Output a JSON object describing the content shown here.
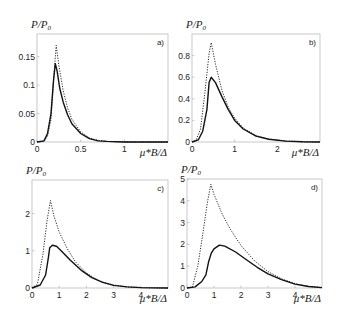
{
  "chart_data": [
    {
      "type": "line",
      "panel": "a)",
      "ylabel": "P/P0",
      "xlabel": "μ*B/Δ",
      "xlim": [
        0,
        1.5
      ],
      "ylim": [
        0,
        0.19
      ],
      "xticks": [
        "0",
        "0.5",
        "1"
      ],
      "yticks": [
        "0",
        "0.05",
        "0.1",
        "0.15"
      ],
      "grid": false,
      "series": [
        {
          "name": "solid",
          "style": "solid",
          "x": [
            0,
            0.08,
            0.12,
            0.16,
            0.19,
            0.21,
            0.23,
            0.26,
            0.3,
            0.35,
            0.4,
            0.5,
            0.6,
            0.7,
            0.8,
            1.0,
            1.2,
            1.5
          ],
          "y": [
            0,
            0.002,
            0.015,
            0.05,
            0.11,
            0.138,
            0.125,
            0.095,
            0.07,
            0.048,
            0.032,
            0.015,
            0.006,
            0.002,
            0.001,
            0,
            0,
            0
          ]
        },
        {
          "name": "dashed",
          "style": "dotted",
          "x": [
            0,
            0.08,
            0.12,
            0.16,
            0.19,
            0.22,
            0.25,
            0.3,
            0.35,
            0.4,
            0.5,
            0.6,
            0.7,
            0.8,
            1.0,
            1.2,
            1.5
          ],
          "y": [
            0,
            0.001,
            0.01,
            0.04,
            0.11,
            0.17,
            0.135,
            0.09,
            0.06,
            0.04,
            0.018,
            0.007,
            0.003,
            0.001,
            0,
            0,
            0
          ]
        }
      ]
    },
    {
      "type": "line",
      "panel": "b)",
      "ylabel": "P/P0",
      "xlabel": "μ*B/Δ",
      "xlim": [
        0,
        3
      ],
      "ylim": [
        0,
        1.0
      ],
      "xticks": [
        "0",
        "1",
        "2"
      ],
      "yticks": [
        "0",
        "0.2",
        "0.4",
        "0.6",
        "0.8"
      ],
      "grid": false,
      "series": [
        {
          "name": "solid",
          "style": "solid",
          "x": [
            0,
            0.15,
            0.25,
            0.35,
            0.4,
            0.45,
            0.55,
            0.7,
            0.85,
            1.0,
            1.2,
            1.5,
            1.8,
            2.2,
            2.6,
            3.0
          ],
          "y": [
            0,
            0.02,
            0.1,
            0.3,
            0.55,
            0.6,
            0.55,
            0.42,
            0.3,
            0.2,
            0.12,
            0.055,
            0.025,
            0.008,
            0.002,
            0
          ]
        },
        {
          "name": "dashed",
          "style": "dotted",
          "x": [
            0,
            0.1,
            0.2,
            0.3,
            0.4,
            0.45,
            0.55,
            0.7,
            0.85,
            1.0,
            1.2,
            1.5,
            1.8,
            2.2,
            2.6,
            3.0
          ],
          "y": [
            0,
            0.02,
            0.12,
            0.45,
            0.82,
            0.92,
            0.72,
            0.48,
            0.32,
            0.22,
            0.13,
            0.06,
            0.027,
            0.009,
            0.002,
            0
          ]
        }
      ]
    },
    {
      "type": "line",
      "panel": "c)",
      "ylabel": "P/P0",
      "xlabel": "μ*B/Δ",
      "xlim": [
        0,
        5
      ],
      "ylim": [
        0,
        2.9
      ],
      "xticks": [
        "0",
        "1",
        "2",
        "3",
        "4"
      ],
      "yticks": [
        "0",
        "1",
        "2"
      ],
      "grid": false,
      "series": [
        {
          "name": "solid",
          "style": "solid",
          "x": [
            0,
            0.3,
            0.5,
            0.6,
            0.65,
            0.75,
            0.9,
            1.1,
            1.4,
            1.8,
            2.2,
            2.6,
            3.0,
            3.5,
            4.0,
            4.5,
            5.0
          ],
          "y": [
            0,
            0.08,
            0.35,
            0.8,
            1.08,
            1.15,
            1.12,
            0.98,
            0.75,
            0.48,
            0.28,
            0.15,
            0.07,
            0.03,
            0.01,
            0.003,
            0
          ]
        },
        {
          "name": "dashed",
          "style": "dotted",
          "x": [
            0,
            0.2,
            0.4,
            0.55,
            0.68,
            0.8,
            1.0,
            1.3,
            1.6,
            2.0,
            2.5,
            3.0,
            3.5,
            4.0,
            4.5,
            5.0
          ],
          "y": [
            0,
            0.1,
            0.9,
            1.8,
            2.35,
            1.95,
            1.5,
            1.05,
            0.7,
            0.4,
            0.18,
            0.08,
            0.03,
            0.01,
            0.003,
            0
          ]
        }
      ]
    },
    {
      "type": "line",
      "panel": "d)",
      "ylabel": "P/P0",
      "xlabel": "μ*B/Δ",
      "xlim": [
        0,
        5
      ],
      "ylim": [
        0,
        5
      ],
      "xticks": [
        "0",
        "1",
        "2",
        "3",
        "4"
      ],
      "yticks": [
        "0",
        "1",
        "2",
        "3",
        "4",
        "5"
      ],
      "grid": false,
      "series": [
        {
          "name": "solid",
          "style": "solid",
          "x": [
            0,
            0.3,
            0.55,
            0.7,
            0.8,
            0.9,
            1.0,
            1.2,
            1.4,
            1.8,
            2.2,
            2.6,
            3.0,
            3.5,
            4.0,
            4.5,
            5.0
          ],
          "y": [
            0,
            0.05,
            0.3,
            0.6,
            1.2,
            1.6,
            1.8,
            1.97,
            1.92,
            1.65,
            1.3,
            0.95,
            0.65,
            0.38,
            0.18,
            0.07,
            0.02
          ]
        },
        {
          "name": "dashed",
          "style": "dotted",
          "x": [
            0,
            0.2,
            0.4,
            0.6,
            0.75,
            0.88,
            1.0,
            1.3,
            1.6,
            2.0,
            2.5,
            3.0,
            3.5,
            4.0,
            4.5,
            5.0
          ],
          "y": [
            0,
            0.05,
            1.0,
            2.6,
            3.9,
            4.75,
            4.3,
            3.4,
            2.7,
            1.95,
            1.25,
            0.75,
            0.42,
            0.2,
            0.08,
            0.02
          ]
        }
      ]
    }
  ],
  "panels": [
    {
      "id": "a)",
      "ylabel_main": "P",
      "ylabel_sub": "0",
      "xlabel": "μ*B/Δ",
      "box": [
        37,
        34,
        168,
        142
      ],
      "yticks": [
        {
          "v": 0,
          "t": "0"
        },
        {
          "v": 0.05,
          "t": "0.05"
        },
        {
          "v": 0.1,
          "t": "0.1"
        },
        {
          "v": 0.15,
          "t": "0.15"
        }
      ],
      "xticks": [
        {
          "v": 0,
          "t": "0"
        },
        {
          "v": 0.5,
          "t": "0.5"
        },
        {
          "v": 1,
          "t": "1"
        }
      ]
    },
    {
      "id": "b)",
      "ylabel_main": "P",
      "ylabel_sub": "0",
      "xlabel": "μ*B/Δ",
      "box": [
        192,
        34,
        320,
        142
      ],
      "yticks": [
        {
          "v": 0,
          "t": "0"
        },
        {
          "v": 0.2,
          "t": "0.2"
        },
        {
          "v": 0.4,
          "t": "0.4"
        },
        {
          "v": 0.6,
          "t": "0.6"
        },
        {
          "v": 0.8,
          "t": "0.8"
        }
      ],
      "xticks": [
        {
          "v": 0,
          "t": "0"
        },
        {
          "v": 1,
          "t": "1"
        },
        {
          "v": 2,
          "t": "2"
        }
      ]
    },
    {
      "id": "c)",
      "ylabel_main": "P",
      "ylabel_sub": "0",
      "xlabel": "μ*B/Δ",
      "box": [
        32,
        180,
        168,
        288
      ],
      "yticks": [
        {
          "v": 0,
          "t": "0"
        },
        {
          "v": 1,
          "t": "1"
        },
        {
          "v": 2,
          "t": "2"
        }
      ],
      "xticks": [
        {
          "v": 0,
          "t": "0"
        },
        {
          "v": 1,
          "t": "1"
        },
        {
          "v": 2,
          "t": "2"
        },
        {
          "v": 3,
          "t": "3"
        },
        {
          "v": 4,
          "t": "4"
        }
      ]
    },
    {
      "id": "d)",
      "ylabel_main": "P",
      "ylabel_sub": "0",
      "xlabel": "μ*B/Δ",
      "box": [
        187,
        179,
        322,
        288
      ],
      "yticks": [
        {
          "v": 0,
          "t": "0"
        },
        {
          "v": 1,
          "t": "1"
        },
        {
          "v": 2,
          "t": "2"
        },
        {
          "v": 3,
          "t": "3"
        },
        {
          "v": 4,
          "t": "4"
        },
        {
          "v": 5,
          "t": "5"
        }
      ],
      "xticks": [
        {
          "v": 0,
          "t": "0"
        },
        {
          "v": 1,
          "t": "1"
        },
        {
          "v": 2,
          "t": "2"
        },
        {
          "v": 3,
          "t": "3"
        },
        {
          "v": 4,
          "t": "4"
        }
      ]
    }
  ],
  "colors": {
    "axis": "#bbbbbb",
    "curve": "#111111",
    "text": "#222222"
  }
}
